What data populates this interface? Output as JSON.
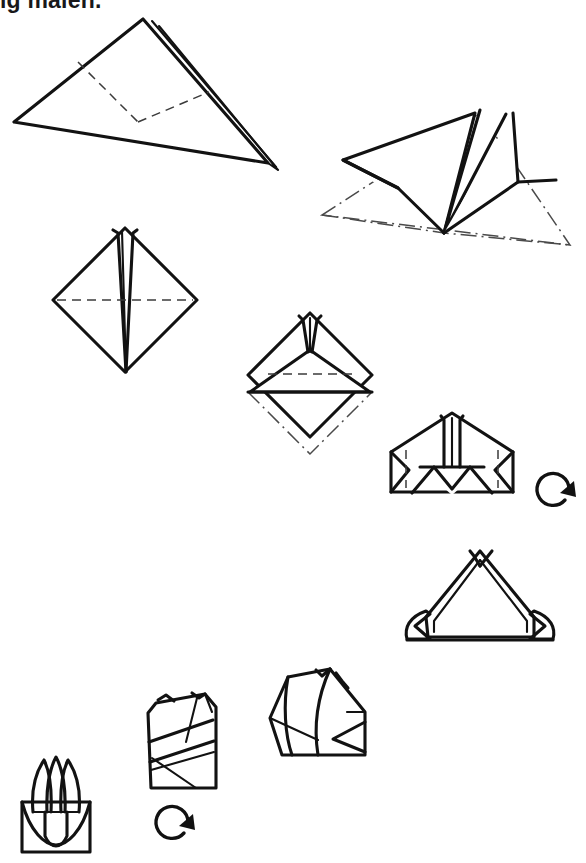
{
  "page": {
    "width": 586,
    "height": 863,
    "background_color": "#ffffff",
    "ink_color": "#121212",
    "clipped_caption_text": "ig malen."
  },
  "legend": {
    "solid_line": "paper edge",
    "dashed_line": "valley fold line",
    "dash_dot_line": "previous position / hidden outline",
    "circular_arrow": "turn model over"
  },
  "steps": [
    {
      "id": 1,
      "name": "folded-triangle-with-fold-lines",
      "description": "Large flat triangle, layered at right edge, with two dashed valley fold lines meeting the lower edge",
      "notation": [
        "solid edges",
        "doubled layer edge",
        "two valley folds"
      ]
    },
    {
      "id": 2,
      "name": "three-dimensional-lift",
      "description": "Triangle opened into three dimensions, original flat outline shown as dash-dot ghost lines",
      "notation": [
        "solid edges",
        "dash-dot ghost outline"
      ]
    },
    {
      "id": 3,
      "name": "diamond-with-center-spike",
      "description": "Square turned on point with a narrow central spike and a horizontal dashed fold across the middle",
      "notation": [
        "solid edges",
        "valley fold"
      ]
    },
    {
      "id": 4,
      "name": "diamond-bottom-point-folded-up",
      "description": "Bottom point folded up behind, previous bottom point shown as dash-dot ghost",
      "notation": [
        "solid edges",
        "valley fold",
        "dash-dot ghost outline"
      ]
    },
    {
      "id": 5,
      "name": "pentagon-with-inner-triangle",
      "description": "Wide pentagon form with an inner triangle and notch, side corners marked by short dashed lines",
      "notation": [
        "solid edges",
        "valley folds"
      ],
      "symbol": "turn-over-arrow"
    },
    {
      "id": 6,
      "name": "triangle-with-curled-side-flaps",
      "description": "Triangular form after turning over, with both side flaps curled outward",
      "notation": [
        "solid edges"
      ]
    },
    {
      "id": 7,
      "name": "wrapped-form-three-quarter-view",
      "description": "Three-quarter view of the form with the side panel wrapped around",
      "notation": [
        "solid edges"
      ]
    },
    {
      "id": 8,
      "name": "wrapped-bundle",
      "description": "Bundle with diagonal wrapping bands and small points at the top",
      "notation": [
        "solid edges"
      ],
      "symbol": "turn-over-arrow"
    },
    {
      "id": 9,
      "name": "finished-tulip",
      "description": "Finished model: three pointed petals above a rounded base with a central leaf",
      "notation": [
        "solid edges"
      ]
    }
  ],
  "symbols": [
    {
      "name": "turn-over-arrow-step-5",
      "label": "turn over",
      "near_step": 5
    },
    {
      "name": "turn-over-arrow-step-8",
      "label": "turn over",
      "near_step": 8
    }
  ]
}
